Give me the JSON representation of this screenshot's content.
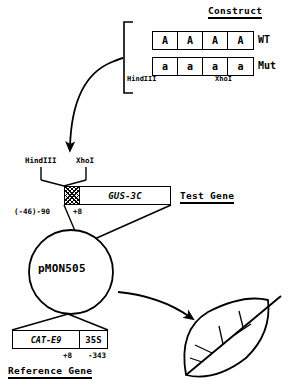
{
  "construct": {
    "heading": "Construct",
    "wt": {
      "label": "WT",
      "cells": [
        "A",
        "A",
        "A",
        "A"
      ]
    },
    "mut": {
      "label": "Mut",
      "cells": [
        "a",
        "a",
        "a",
        "a"
      ]
    },
    "restriction_left": "HindIII",
    "restriction_right": "XhoI"
  },
  "test_gene": {
    "heading": "Test Gene",
    "restriction_left": "HindIII",
    "restriction_right": "XhoI",
    "promoter_region": "hatched-box",
    "gene_label": "GUS-3C",
    "position_left": "(-46)-90",
    "position_right": "+8"
  },
  "plasmid": {
    "name": "pMON505"
  },
  "reference_gene": {
    "heading": "Reference Gene",
    "gene_label": "CAT-E9",
    "promoter_label": "35S",
    "position_left": "+8",
    "position_right": "-343"
  },
  "target": {
    "name": "leaf"
  },
  "colors": {
    "stroke": "#000000",
    "background": "#ffffff"
  }
}
